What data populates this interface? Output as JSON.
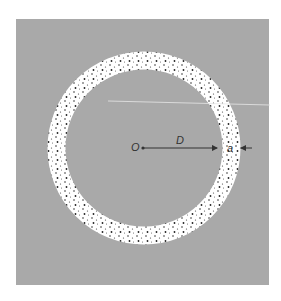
{
  "figure": {
    "background_color": "#a9a9a9",
    "ring_color": "#ffffff",
    "speckle_color": "#333333",
    "center_label": "O",
    "radius_label": "D",
    "thickness_label": "a"
  }
}
